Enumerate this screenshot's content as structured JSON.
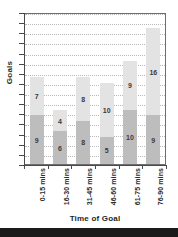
{
  "chart_data": {
    "type": "bar",
    "stacked": true,
    "title": "",
    "xlabel": "Time of Goal",
    "ylabel": "Goals",
    "categories": [
      "0-15 mins",
      "16-30 mins",
      "31-45 mins",
      "46-60 mins",
      "61-75 mins",
      "76-90 mins"
    ],
    "series": [
      {
        "name": "lower-segment",
        "color": "#bdbdbd",
        "values": [
          9,
          6,
          8,
          5,
          10,
          9
        ]
      },
      {
        "name": "upper-segment",
        "color": "#e3e3e3",
        "values": [
          7,
          4,
          8,
          10,
          9,
          16
        ]
      }
    ],
    "totals": [
      16,
      10,
      16,
      15,
      19,
      25
    ],
    "ylim": [
      0,
      28
    ],
    "y_tick_count": 15,
    "grid": "horizontal-dotted",
    "y_tick_labels": [],
    "legend": "none",
    "data_labels": true
  },
  "axes": {
    "y_title": "Goals",
    "x_title": "Time of Goal"
  },
  "colors": {
    "segment_upper": "#e3e3e3",
    "segment_lower": "#bdbdbd",
    "gridline": "#b9b9b9",
    "axis": "#4a4a4a",
    "plot_border": "#6e6e6e",
    "label_text": "#3a3a3a",
    "footer_band": "#1a1a1a",
    "background": "#ffffff"
  }
}
